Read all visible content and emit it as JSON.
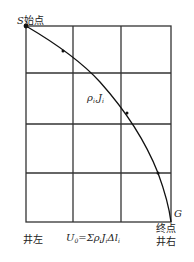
{
  "diagram": {
    "grid": {
      "columns": 3,
      "rows": 4,
      "line_color": "#333333"
    },
    "start": {
      "symbol": "S",
      "label": "始点"
    },
    "end": {
      "symbol": "G",
      "label": "终点"
    },
    "path_label": {
      "rho": "ρ",
      "sub_i": "i",
      "sep": ",",
      "J": "J"
    },
    "formula": {
      "U0": "U",
      "U0_sub": "0",
      "eq": "=Σρ",
      "sub_i": "i",
      "J": "J",
      "dl": "Δl"
    },
    "left_well": "井左",
    "right_well": "井右"
  }
}
